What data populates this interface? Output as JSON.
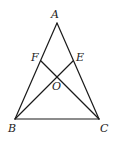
{
  "diagram": {
    "type": "geometry-triangle",
    "stroke_color": "#1a1a1a",
    "label_color": "#222222",
    "points": {
      "A": {
        "label": "A",
        "x": 57,
        "y": 23,
        "lx": 51,
        "ly": 18
      },
      "B": {
        "label": "B",
        "x": 15,
        "y": 119,
        "lx": 8,
        "ly": 132
      },
      "C": {
        "label": "C",
        "x": 99,
        "y": 119,
        "lx": 100,
        "ly": 132
      },
      "E": {
        "label": "E",
        "x": 73,
        "y": 61,
        "lx": 76,
        "ly": 61
      },
      "F": {
        "label": "F",
        "x": 41,
        "y": 61,
        "lx": 31,
        "ly": 61
      },
      "O": {
        "label": "O",
        "x": 57,
        "y": 76,
        "lx": 52,
        "ly": 90
      }
    },
    "segments": [
      {
        "from": "A",
        "to": "B"
      },
      {
        "from": "A",
        "to": "C"
      },
      {
        "from": "B",
        "to": "C"
      },
      {
        "from": "B",
        "to": "E"
      },
      {
        "from": "C",
        "to": "F"
      }
    ]
  }
}
